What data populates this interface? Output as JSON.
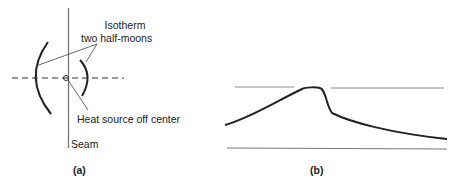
{
  "panel_a": {
    "caption": "(a)",
    "labels": {
      "isotherm_line1": "Isotherm",
      "isotherm_line2": "two half-moons",
      "heat_source": "Heat source off center",
      "seam": "Seam"
    }
  },
  "panel_b": {
    "caption": "(b)"
  },
  "colors": {
    "stroke": "#222222",
    "seam": "#777777",
    "thin_line": "#888888"
  }
}
